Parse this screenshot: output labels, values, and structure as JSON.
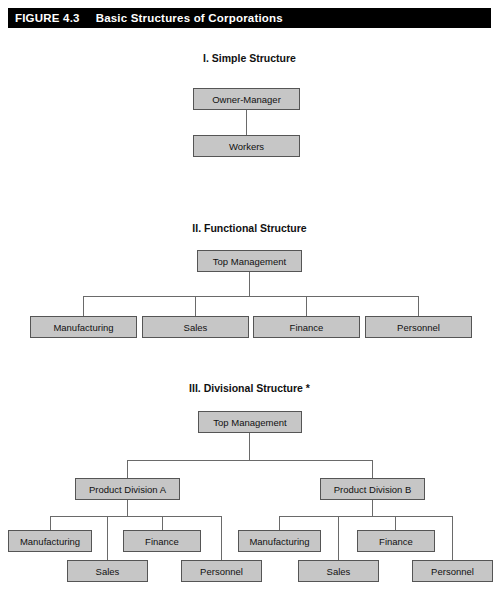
{
  "figure": {
    "label": "FIGURE 4.3",
    "title": "Basic Structures of Corporations"
  },
  "sections": [
    {
      "heading": "I. Simple Structure",
      "nodes": {
        "top": "Owner-Manager",
        "bottom": "Workers"
      }
    },
    {
      "heading": "II. Functional Structure",
      "nodes": {
        "top": "Top Management",
        "functions": [
          "Manufacturing",
          "Sales",
          "Finance",
          "Personnel"
        ]
      }
    },
    {
      "heading": "III. Divisional Structure *",
      "nodes": {
        "top": "Top Management",
        "divisions": [
          {
            "name": "Product Division A",
            "functions": [
              "Manufacturing",
              "Sales",
              "Finance",
              "Personnel"
            ]
          },
          {
            "name": "Product Division B",
            "functions": [
              "Manufacturing",
              "Sales",
              "Finance",
              "Personnel"
            ]
          }
        ]
      }
    }
  ],
  "colors": {
    "header_background": "#000000",
    "header_text": "#ffffff",
    "box_fill": "#c6c6c6",
    "box_border": "#555555",
    "connector": "#6a6a6a",
    "page_background": "#ffffff"
  }
}
